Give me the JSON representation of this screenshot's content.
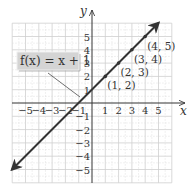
{
  "figure": {
    "function_label": "f(x) = x + 1",
    "x_axis_label": "x",
    "y_axis_label": "y",
    "x_ticks": [
      "-5",
      "-4",
      "-3",
      "-2",
      "-1",
      "1",
      "2",
      "3",
      "4",
      "5"
    ],
    "y_ticks": [
      "5",
      "4",
      "3",
      "2",
      "1",
      "-1",
      "-2",
      "-3",
      "-4",
      "-5"
    ],
    "points": [
      {
        "label": "(1, 2)",
        "x": 1,
        "y": 2
      },
      {
        "label": "(2, 3)",
        "x": 2,
        "y": 3
      },
      {
        "label": "(3, 4)",
        "x": 3,
        "y": 4
      },
      {
        "label": "(4, 5)",
        "x": 4,
        "y": 5
      }
    ],
    "colors": {
      "line": "#333333",
      "grid": "#cccccc",
      "label_box": "#d4d4d4"
    }
  }
}
